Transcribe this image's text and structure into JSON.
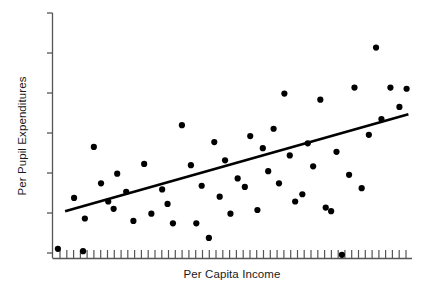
{
  "chart_data": {
    "type": "scatter",
    "title": "",
    "xlabel": "Per Capita Income",
    "ylabel": "Per Pupil Expenditures",
    "xlim": [
      0,
      100
    ],
    "ylim": [
      0,
      100
    ],
    "grid": false,
    "legend": null,
    "axis_tick_labels": {
      "x": [],
      "y": []
    },
    "x_tick_count": 52,
    "y_tick_count": 7,
    "marker": {
      "shape": "circle",
      "color": "#000000",
      "size_px": 4.4
    },
    "trendline": {
      "name": "least-squares regression line",
      "color": "#000000",
      "width_px": 2.6,
      "x0": 3.5,
      "y0": 19.5,
      "x1": 99.0,
      "y1": 59.5
    },
    "points": [
      {
        "x": 1.5,
        "y": 4.0
      },
      {
        "x": 6.0,
        "y": 25.0
      },
      {
        "x": 8.5,
        "y": 3.0
      },
      {
        "x": 9.0,
        "y": 16.5
      },
      {
        "x": 11.5,
        "y": 46.0
      },
      {
        "x": 13.5,
        "y": 31.0
      },
      {
        "x": 15.5,
        "y": 23.5
      },
      {
        "x": 17.0,
        "y": 20.5
      },
      {
        "x": 18.0,
        "y": 35.0
      },
      {
        "x": 20.5,
        "y": 27.5
      },
      {
        "x": 22.5,
        "y": 15.5
      },
      {
        "x": 25.5,
        "y": 39.0
      },
      {
        "x": 27.5,
        "y": 18.5
      },
      {
        "x": 30.5,
        "y": 28.5
      },
      {
        "x": 32.0,
        "y": 22.5
      },
      {
        "x": 33.5,
        "y": 14.5
      },
      {
        "x": 36.0,
        "y": 55.0
      },
      {
        "x": 38.5,
        "y": 38.5
      },
      {
        "x": 40.0,
        "y": 14.5
      },
      {
        "x": 41.5,
        "y": 30.0
      },
      {
        "x": 43.5,
        "y": 8.5
      },
      {
        "x": 45.0,
        "y": 48.0
      },
      {
        "x": 46.5,
        "y": 25.5
      },
      {
        "x": 48.0,
        "y": 40.5
      },
      {
        "x": 49.5,
        "y": 18.5
      },
      {
        "x": 51.5,
        "y": 33.0
      },
      {
        "x": 53.5,
        "y": 29.5
      },
      {
        "x": 55.0,
        "y": 50.5
      },
      {
        "x": 57.0,
        "y": 20.0
      },
      {
        "x": 58.5,
        "y": 45.5
      },
      {
        "x": 60.0,
        "y": 36.0
      },
      {
        "x": 61.5,
        "y": 53.5
      },
      {
        "x": 63.0,
        "y": 31.0
      },
      {
        "x": 64.5,
        "y": 68.0
      },
      {
        "x": 66.0,
        "y": 42.5
      },
      {
        "x": 67.5,
        "y": 23.5
      },
      {
        "x": 69.5,
        "y": 26.5
      },
      {
        "x": 71.0,
        "y": 47.5
      },
      {
        "x": 72.5,
        "y": 38.0
      },
      {
        "x": 74.5,
        "y": 65.5
      },
      {
        "x": 76.0,
        "y": 21.0
      },
      {
        "x": 77.5,
        "y": 19.5
      },
      {
        "x": 79.0,
        "y": 44.0
      },
      {
        "x": 80.5,
        "y": 1.5
      },
      {
        "x": 82.5,
        "y": 34.5
      },
      {
        "x": 84.0,
        "y": 70.5
      },
      {
        "x": 86.0,
        "y": 29.0
      },
      {
        "x": 88.0,
        "y": 51.0
      },
      {
        "x": 90.0,
        "y": 87.0
      },
      {
        "x": 91.5,
        "y": 57.5
      },
      {
        "x": 94.0,
        "y": 70.5
      },
      {
        "x": 96.5,
        "y": 62.5
      },
      {
        "x": 98.5,
        "y": 70.0
      }
    ]
  },
  "axes": {
    "x_label": "Per Capita Income",
    "y_label": "Per Pupil Expenditures",
    "axis_color": "#555555",
    "tick_color": "#555555"
  }
}
